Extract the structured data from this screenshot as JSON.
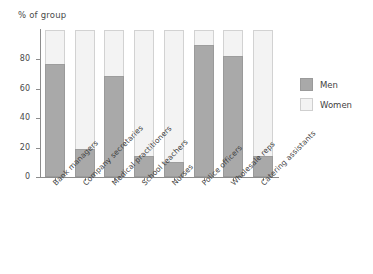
{
  "chart_data": {
    "type": "bar",
    "subtype": "stacked-percentage",
    "title": "% of group",
    "xlabel": "",
    "ylabel": "% of group",
    "ylim": [
      0,
      100
    ],
    "yticks": [
      0,
      20,
      40,
      60,
      80
    ],
    "ytick_labels": [
      "0",
      "20",
      "40",
      "60",
      "80"
    ],
    "grid": false,
    "legend_position": "right",
    "categories": [
      "Bank managers",
      "Company secretaries",
      "Medical practitioners",
      "School teachers",
      "Nurses",
      "Police officers",
      "Wholesale reps",
      "Catering assistants"
    ],
    "series": [
      {
        "name": "Men",
        "color": "#a9a9a9",
        "values": [
          77,
          19,
          69,
          14,
          10,
          90,
          82,
          14
        ]
      },
      {
        "name": "Women",
        "color": "#f3f3f3",
        "values": [
          23,
          81,
          31,
          86,
          90,
          10,
          18,
          86
        ]
      }
    ]
  },
  "legend": {
    "items": [
      {
        "label": "Men",
        "swatch": "men-swatch"
      },
      {
        "label": "Women",
        "swatch": "women-swatch"
      }
    ]
  },
  "colors": {
    "men": "#a9a9a9",
    "women": "#f3f3f3",
    "axis": "#8c8c8c",
    "text": "#3f3f3f",
    "background": "#ffffff"
  }
}
